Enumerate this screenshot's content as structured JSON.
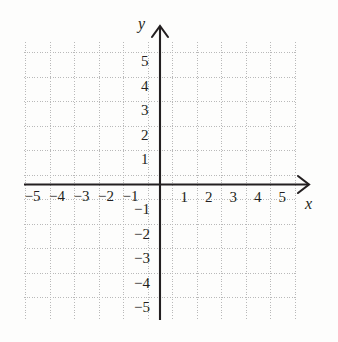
{
  "figure": {
    "kind": "cartesian-coordinate-grid",
    "background_color": "#fdfdfc",
    "grid_color": "#b9b9b9",
    "axis_color": "#231f20",
    "label_color": "#231f20"
  },
  "geometry": {
    "origin_x": 160,
    "origin_y": 184.5,
    "cell_size": 24.5,
    "grid_left": 24,
    "grid_right": 297,
    "grid_top": 42,
    "grid_bottom": 320
  },
  "axes": {
    "x": {
      "name": "x",
      "minus_sign": "−",
      "negative_labels": [
        "−5",
        "−4",
        "−3",
        "−2",
        "−1"
      ],
      "negative_values": [
        -5,
        -4,
        -3,
        -2,
        -1
      ],
      "positive_labels": [
        "1",
        "2",
        "3",
        "4",
        "5"
      ],
      "positive_values": [
        1,
        2,
        3,
        4,
        5
      ],
      "range": [
        -5.5,
        5.6
      ],
      "arrow": "arrow-right"
    },
    "y": {
      "name": "y",
      "minus_sign": "−",
      "positive_labels": [
        "5",
        "4",
        "3",
        "2",
        "1"
      ],
      "positive_values": [
        5,
        4,
        3,
        2,
        1
      ],
      "negative_labels": [
        "−1",
        "−2",
        "−3",
        "−4",
        "−5"
      ],
      "negative_values": [
        -1,
        -2,
        -3,
        -4,
        -5
      ],
      "range": [
        -5.6,
        5.8
      ],
      "arrow": "arrow-up"
    }
  },
  "chart_data": {
    "type": "scatter",
    "title": "",
    "xlabel": "x",
    "ylabel": "y",
    "series": [],
    "x": [],
    "y": [],
    "xlim": [
      -5.5,
      5.6
    ],
    "ylim": [
      -5.6,
      5.8
    ],
    "xticks": [
      -5,
      -4,
      -3,
      -2,
      -1,
      1,
      2,
      3,
      4,
      5
    ],
    "yticks": [
      -5,
      -4,
      -3,
      -2,
      -1,
      1,
      2,
      3,
      4,
      5
    ],
    "xticklabels": [
      "−5",
      "−4",
      "−3",
      "−2",
      "−1",
      "1",
      "2",
      "3",
      "4",
      "5"
    ],
    "yticklabels": [
      "−5",
      "−4",
      "−3",
      "−2",
      "−1",
      "1",
      "2",
      "3",
      "4",
      "5"
    ],
    "grid": true,
    "grid_style": "dotted",
    "legend": false,
    "annotations": []
  }
}
